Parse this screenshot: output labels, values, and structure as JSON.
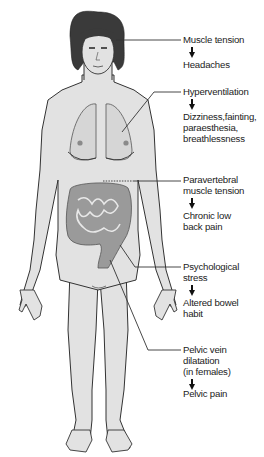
{
  "diagram": {
    "type": "annotated anatomical figure",
    "colors": {
      "skin": "#e2e2e2",
      "outline": "#333333",
      "hair": "#3a3a3a",
      "organs": "#d2d2d2",
      "bowel": "#9a9a9a",
      "leader_line": "#333333",
      "text": "#222222"
    },
    "annotations": [
      {
        "id": "head",
        "cause": "Muscle tension",
        "effect": "Headaches",
        "target": "head / temple"
      },
      {
        "id": "lungs",
        "cause": "Hyperventilation",
        "effect": "Dizziness,fainting,\nparaesthesia,\nbreathlessness",
        "target": "left lung"
      },
      {
        "id": "back",
        "cause": "Paravertebral\nmuscle tension",
        "effect": "Chronic low\nback pain",
        "target": "lower back (dashed)"
      },
      {
        "id": "bowel",
        "cause": "Psychological\nstress",
        "effect": "Altered bowel\nhabit",
        "target": "colon"
      },
      {
        "id": "pelvis",
        "cause": "Pelvic vein\ndilatation\n(in females)",
        "effect": "Pelvic pain",
        "target": "pelvis"
      }
    ]
  }
}
